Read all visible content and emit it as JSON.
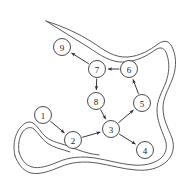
{
  "figure": {
    "background_color": "#ffffff",
    "node_fill": "#ffffff",
    "node_stroke": "#4a4a4a",
    "edge_color": "#3a3a3a",
    "boundary_color": "#5b5b5b",
    "width": 186,
    "height": 192
  },
  "graph": {
    "node_radius": 8.5,
    "nodes": [
      {
        "id": "1",
        "label": "1",
        "x": 43,
        "y": 115
      },
      {
        "id": "2",
        "label": "2",
        "x": 73,
        "y": 140
      },
      {
        "id": "3",
        "label": "3",
        "x": 111,
        "y": 129
      },
      {
        "id": "4",
        "label": "4",
        "x": 145,
        "y": 150
      },
      {
        "id": "5",
        "label": "5",
        "x": 142,
        "y": 103
      },
      {
        "id": "6",
        "label": "6",
        "x": 129,
        "y": 69
      },
      {
        "id": "7",
        "label": "7",
        "x": 97,
        "y": 69
      },
      {
        "id": "8",
        "label": "8",
        "x": 96,
        "y": 101
      },
      {
        "id": "9",
        "label": "9",
        "x": 62,
        "y": 47
      }
    ],
    "edges": [
      {
        "from": "1",
        "to": "2"
      },
      {
        "from": "2",
        "to": "3"
      },
      {
        "from": "3",
        "to": "4"
      },
      {
        "from": "3",
        "to": "5"
      },
      {
        "from": "5",
        "to": "6"
      },
      {
        "from": "6",
        "to": "7"
      },
      {
        "from": "7",
        "to": "9"
      },
      {
        "from": "7",
        "to": "8"
      },
      {
        "from": "8",
        "to": "3"
      }
    ]
  },
  "boundary": {
    "paths": [
      "M 46 21 C 62 26, 78 33, 92 42 C 104 50, 114 58, 128 57 C 140 56, 150 50, 158 44 C 165 39, 170 41, 173 49 C 177 59, 176 70, 172 80 C 168 90, 163 98, 163 108 C 163 119, 168 128, 172 138 C 175 147, 173 156, 166 162 C 158 169, 147 171, 136 170 C 122 169, 110 165, 97 163 C 84 161, 71 162, 60 167 C 50 171, 40 175, 31 173 C 23 171, 18 164, 15 156",
      "M 46 21 C 60 30, 74 38, 88 47 C 100 55, 111 63, 125 62 C 137 61, 147 56, 155 50 C 161 46, 165 48, 167 55 C 170 64, 169 73, 166 82 C 162 92, 157 100, 157 110 C 157 120, 161 129, 165 139 C 168 147, 166 154, 160 159 C 153 164, 143 166, 133 165 C 120 164, 108 160, 95 158 C 82 156, 69 157, 58 162 C 48 166, 39 169, 32 167 C 25 165, 21 159, 19 152",
      "M 15 156 C 13 147, 14 138, 18 131 C 22 124, 28 120, 33 123 C 38 126, 41 133, 46 137 C 52 142, 60 143, 68 146 C 78 150, 88 154, 99 155",
      "M 19 152 C 18 145, 19 138, 22 133 C 25 128, 30 126, 34 129 C 38 133, 42 139, 47 143 C 54 148, 62 149, 70 152"
    ]
  }
}
